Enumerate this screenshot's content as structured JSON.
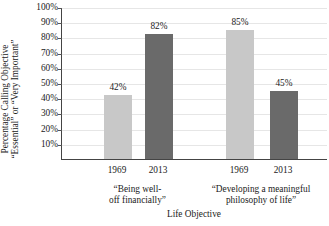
{
  "chart_data": {
    "type": "bar",
    "title": "",
    "xlabel": "Life Objective",
    "ylabel_line1": "Percentage Calling Objective",
    "ylabel_line2": "“Essential” or “Very Important”",
    "ylim": [
      0,
      100
    ],
    "ytick_labels": [
      "100%",
      "90%",
      "80%",
      "70%",
      "60%",
      "50%",
      "40%",
      "30%",
      "20%",
      "10%"
    ],
    "ytick_values": [
      100,
      90,
      80,
      70,
      60,
      50,
      40,
      30,
      20,
      10
    ],
    "grid": true,
    "legend": "none",
    "categories": [
      "“Being well-off financially”",
      "“Developing a meaningful philosophy of life”"
    ],
    "series": [
      {
        "name": "1969",
        "values": [
          42,
          85
        ],
        "color": "#c8c8c8"
      },
      {
        "name": "2013",
        "values": [
          82,
          45
        ],
        "color": "#6a6a6a"
      }
    ],
    "bars": [
      {
        "group": 0,
        "series": "1969",
        "value": 42,
        "label": "42%",
        "color": "#c8c8c8"
      },
      {
        "group": 0,
        "series": "2013",
        "value": 82,
        "label": "82%",
        "color": "#6a6a6a"
      },
      {
        "group": 1,
        "series": "1969",
        "value": 85,
        "label": "85%",
        "color": "#c8c8c8"
      },
      {
        "group": 1,
        "series": "2013",
        "value": 45,
        "label": "45%",
        "color": "#6a6a6a"
      }
    ],
    "x_tick_labels": [
      "1969",
      "2013",
      "1969",
      "2013"
    ],
    "group_labels": [
      {
        "line1": "“Being well-",
        "line2": "off financially”"
      },
      {
        "line1": "“Developing a meaningful",
        "line2": "philosophy of life”"
      }
    ]
  }
}
